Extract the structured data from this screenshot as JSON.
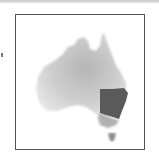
{
  "map": {
    "subject": "Australia",
    "highlighted_region": "New South Wales",
    "colors": {
      "land_light": "#d9d9d9",
      "land_mid": "#b8b8b8",
      "highlight": "#5a5a5a",
      "victoria": "#a8a8a8",
      "tasmania": "#8a8a8a",
      "frame_border": "#555555"
    }
  }
}
